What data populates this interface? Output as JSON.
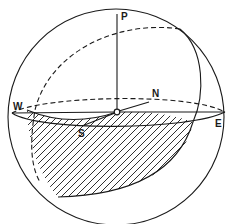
{
  "diagram": {
    "labels": {
      "pole": "P",
      "north": "N",
      "south": "S",
      "east": "E",
      "west": "W"
    },
    "colors": {
      "ink": "#1a1a1a",
      "background": "#ffffff"
    }
  }
}
